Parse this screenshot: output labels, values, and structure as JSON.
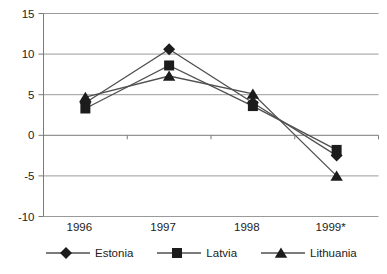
{
  "chart_data": {
    "type": "line",
    "title": "",
    "xlabel": "",
    "ylabel": "",
    "categories": [
      "1996",
      "1997",
      "1998",
      "1999*"
    ],
    "series": [
      {
        "name": "Estonia",
        "marker": "diamond",
        "values": [
          4.0,
          10.6,
          4.0,
          -2.5
        ]
      },
      {
        "name": "Latvia",
        "marker": "square",
        "values": [
          3.3,
          8.6,
          3.6,
          -1.8
        ]
      },
      {
        "name": "Lithuania",
        "marker": "triangle",
        "values": [
          4.7,
          7.3,
          5.1,
          -5.0
        ]
      }
    ],
    "y_axis": {
      "min": -10,
      "max": 15,
      "step": 5,
      "tick_labels": [
        "-10",
        "-5",
        "0",
        "5",
        "10",
        "15"
      ]
    },
    "x_axis": {
      "crosses_at": 0,
      "labels_position": "bottom"
    },
    "grid": true,
    "legend_position": "bottom",
    "colors": {
      "background": "#ffffff",
      "gridline": "#9a9a9a",
      "axis": "#7a7a7a",
      "series_line": "#4f4f4f",
      "marker_fill": "#1c1c1c",
      "text": "#1c1c1c"
    }
  }
}
